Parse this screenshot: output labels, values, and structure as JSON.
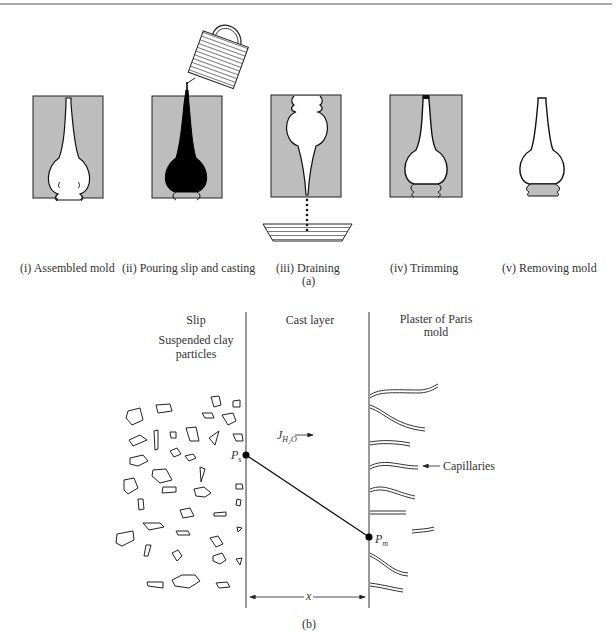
{
  "figure_a": {
    "steps": [
      {
        "label": "(i) Assembled mold"
      },
      {
        "label": "(ii) Pouring slip and casting"
      },
      {
        "label": "(iii) Draining"
      },
      {
        "label": "(iv) Trimming"
      },
      {
        "label": "(v) Removing mold"
      }
    ],
    "caption": "(a)",
    "colors": {
      "mold": "#bdbdbd",
      "slip": "#000000",
      "outline": "#1a1a1a"
    }
  },
  "figure_b": {
    "regions": {
      "slip_title": "Slip",
      "slip_subtitle_line1": "Suspended clay",
      "slip_subtitle_line2": "particles",
      "cast_title": "Cast layer",
      "mold_title_line1": "Plaster of Paris",
      "mold_title_line2": "mold"
    },
    "flux_label": "J",
    "flux_subscript": "H₂O",
    "flux_arrow": "→",
    "point_s": "P",
    "point_s_sub": "s",
    "point_m": "P",
    "point_m_sub": "m",
    "capillaries_label": "Capillaries",
    "thickness_label": "x",
    "caption": "(b)"
  }
}
